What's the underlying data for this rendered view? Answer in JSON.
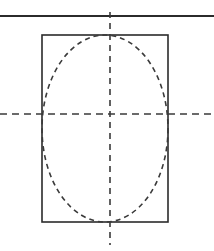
{
  "figure": {
    "title": "",
    "type": "engineering-drawing",
    "canvas": {
      "width": 214,
      "height": 251,
      "background": "#ffffff"
    },
    "colors": {
      "outline": "#2b2b2b",
      "hidden_edge": "#3a3a3a",
      "centerline": "#3a3a3a",
      "background": "#ffffff"
    },
    "elements": {
      "top_edge_line": {
        "label": "top edge line",
        "style": "solid",
        "stroke": "#2b2b2b",
        "width": 1.8,
        "x1": 0,
        "y1": 16,
        "x2": 214,
        "y2": 16
      },
      "rectangle": {
        "label": "front view outline",
        "style": "solid",
        "stroke": "#2b2b2b",
        "width": 1.6,
        "x": 42,
        "y": 35,
        "rect_width": 126,
        "rect_height": 187
      },
      "ellipse": {
        "label": "hidden circular feature",
        "style": "dashed",
        "stroke": "#3a3a3a",
        "width": 1.6,
        "dash": "5,4",
        "cx": 105,
        "cy": 128.5,
        "rx": 63,
        "ry": 93.5
      },
      "vertical_centerline": {
        "label": "vertical centerline",
        "style": "dash-dot",
        "stroke": "#3a3a3a",
        "width": 1.6,
        "dash": "6,5",
        "x1": 110,
        "y1": 12,
        "x2": 110,
        "y2": 245
      },
      "horizontal_centerline": {
        "label": "horizontal centerline",
        "style": "dash-dot",
        "stroke": "#3a3a3a",
        "width": 1.6,
        "dash": "7,5",
        "x1": 0,
        "y1": 114,
        "x2": 214,
        "y2": 114
      }
    }
  }
}
